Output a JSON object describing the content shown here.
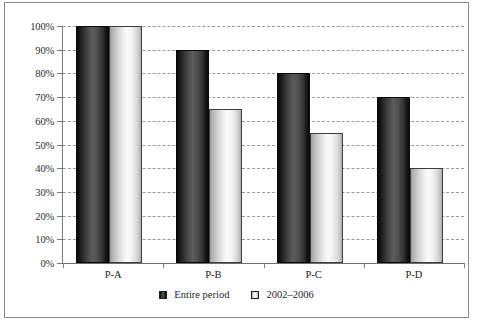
{
  "chart_data": {
    "type": "bar",
    "title": "",
    "xlabel": "",
    "ylabel": "",
    "categories": [
      "P-A",
      "P-B",
      "P-C",
      "P-D"
    ],
    "series": [
      {
        "name": "Entire period",
        "values": [
          100,
          90,
          80,
          70
        ]
      },
      {
        "name": "2002–2006",
        "values": [
          100,
          65,
          55,
          40
        ]
      }
    ],
    "ylim": [
      0,
      100
    ],
    "ytick_values": [
      0,
      10,
      20,
      30,
      40,
      50,
      60,
      70,
      80,
      90,
      100
    ],
    "ytick_labels": [
      "0%",
      "10%",
      "20%",
      "30%",
      "40%",
      "50%",
      "60%",
      "70%",
      "80%",
      "90%",
      "100%"
    ],
    "grid": true,
    "gridline_style": "dashed",
    "legend_position": "bottom-center",
    "value_format": "percent"
  },
  "legend": {
    "entries": [
      {
        "label": "Entire period",
        "swatch": "dark"
      },
      {
        "label": "2002–2006",
        "swatch": "light"
      }
    ]
  },
  "colors": {
    "series_entire_period": "#4a4a4a",
    "series_2002_2006": "#ededed",
    "gridline": "#9a9a9a",
    "axis": "#6d6d6d",
    "frame_border": "#8a8a8a",
    "background": "#ffffff",
    "text": "#222222"
  }
}
